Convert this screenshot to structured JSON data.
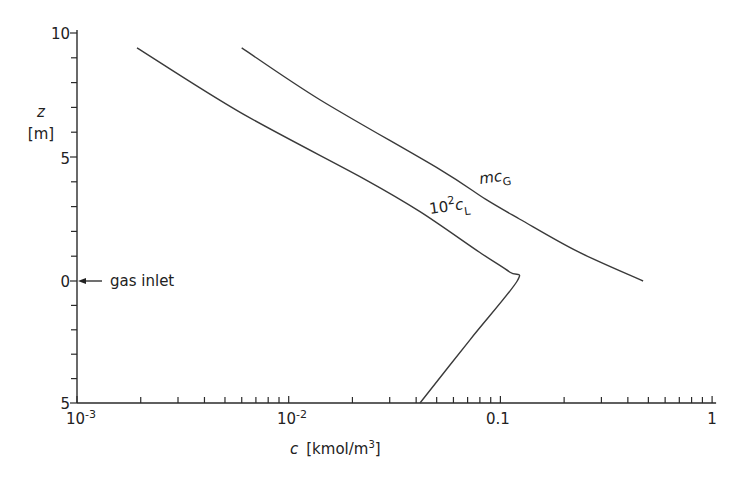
{
  "chart_data": {
    "type": "line",
    "title": "",
    "xlabel": "c [kmol/m³]",
    "xlabel_var": "c",
    "xlabel_unit": "[kmol/m",
    "xlabel_unit_sup": "3",
    "xlabel_unit_end": "]",
    "ylabel_var": "z",
    "ylabel_unit": "[m]",
    "xscale": "log",
    "xlim": [
      0.001,
      1
    ],
    "x_ticks": [
      {
        "value": 0.001,
        "base": "10",
        "exp": "-3"
      },
      {
        "value": 0.01,
        "base": "10",
        "exp": "-2"
      },
      {
        "value": 0.1,
        "base": "0.1",
        "exp": ""
      },
      {
        "value": 1,
        "base": "1",
        "exp": ""
      }
    ],
    "y_axis_note": "height above gas inlet (top: 0 to 10) and depth below gas inlet (bottom: 0 to 5)",
    "ylim": [
      -5,
      10
    ],
    "y_ticks": [
      {
        "value": 10,
        "label": "10"
      },
      {
        "value": 5,
        "label": "5"
      },
      {
        "value": 0,
        "label": "0"
      },
      {
        "value": -5,
        "label": "5"
      }
    ],
    "annotation": {
      "text": "gas inlet",
      "at_z": 0
    },
    "grid": false,
    "series": [
      {
        "name": "10²c_L",
        "label_base": "10",
        "label_sup": "2",
        "label_var": "c",
        "label_sub": "L",
        "points": [
          {
            "c": 0.00192,
            "z": 9.4
          },
          {
            "c": 0.0059,
            "z": 6.8
          },
          {
            "c": 0.0229,
            "z": 4.1
          },
          {
            "c": 0.0417,
            "z": 2.8
          },
          {
            "c": 0.08,
            "z": 1.15
          },
          {
            "c": 0.111,
            "z": 0.35
          },
          {
            "c": 0.12,
            "z": 0.0
          },
          {
            "c": 0.072,
            "z": -2.4
          },
          {
            "c": 0.0417,
            "z": -5.0
          }
        ]
      },
      {
        "name": "mc_G",
        "label_var": "mc",
        "label_sub": "G",
        "points": [
          {
            "c": 0.006,
            "z": 9.4
          },
          {
            "c": 0.0141,
            "z": 7.3
          },
          {
            "c": 0.0517,
            "z": 4.5
          },
          {
            "c": 0.085,
            "z": 3.3
          },
          {
            "c": 0.123,
            "z": 2.5
          },
          {
            "c": 0.23,
            "z": 1.2
          },
          {
            "c": 0.472,
            "z": 0.0
          }
        ]
      }
    ]
  }
}
